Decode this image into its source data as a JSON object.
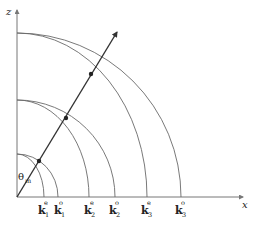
{
  "diagram": {
    "axes": {
      "x_label": "x",
      "z_label": "z",
      "origin": [
        17,
        197
      ]
    },
    "angle_label": {
      "symbol": "θ",
      "subscript": "m"
    },
    "arcs": [
      {
        "id": "k1e",
        "type": "ellipse",
        "rx": 27,
        "rz": 43
      },
      {
        "id": "k1o",
        "type": "circle",
        "rx": 41,
        "rz": 43
      },
      {
        "id": "k2e",
        "type": "ellipse",
        "rx": 72,
        "rz": 97
      },
      {
        "id": "k2o",
        "type": "circle",
        "rx": 98,
        "rz": 97
      },
      {
        "id": "k3e",
        "type": "ellipse",
        "rx": 130,
        "rz": 164
      },
      {
        "id": "k3o",
        "type": "circle",
        "rx": 164,
        "rz": 164
      }
    ],
    "k_labels": [
      {
        "base": "k",
        "sub": "1",
        "sup": "e",
        "x": 44
      },
      {
        "base": "k",
        "sub": "1",
        "sup": "o",
        "x": 58
      },
      {
        "base": "k",
        "sub": "2",
        "sup": "e",
        "x": 89
      },
      {
        "base": "k",
        "sub": "2",
        "sup": "o",
        "x": 115
      },
      {
        "base": "k",
        "sub": "3",
        "sup": "e",
        "x": 147
      },
      {
        "base": "k",
        "sub": "3",
        "sup": "o",
        "x": 181
      }
    ],
    "ray": {
      "from": [
        17,
        197
      ],
      "to": [
        117,
        31
      ],
      "points": [
        [
          39,
          161
        ],
        [
          66,
          118
        ],
        [
          91,
          74
        ]
      ]
    }
  }
}
